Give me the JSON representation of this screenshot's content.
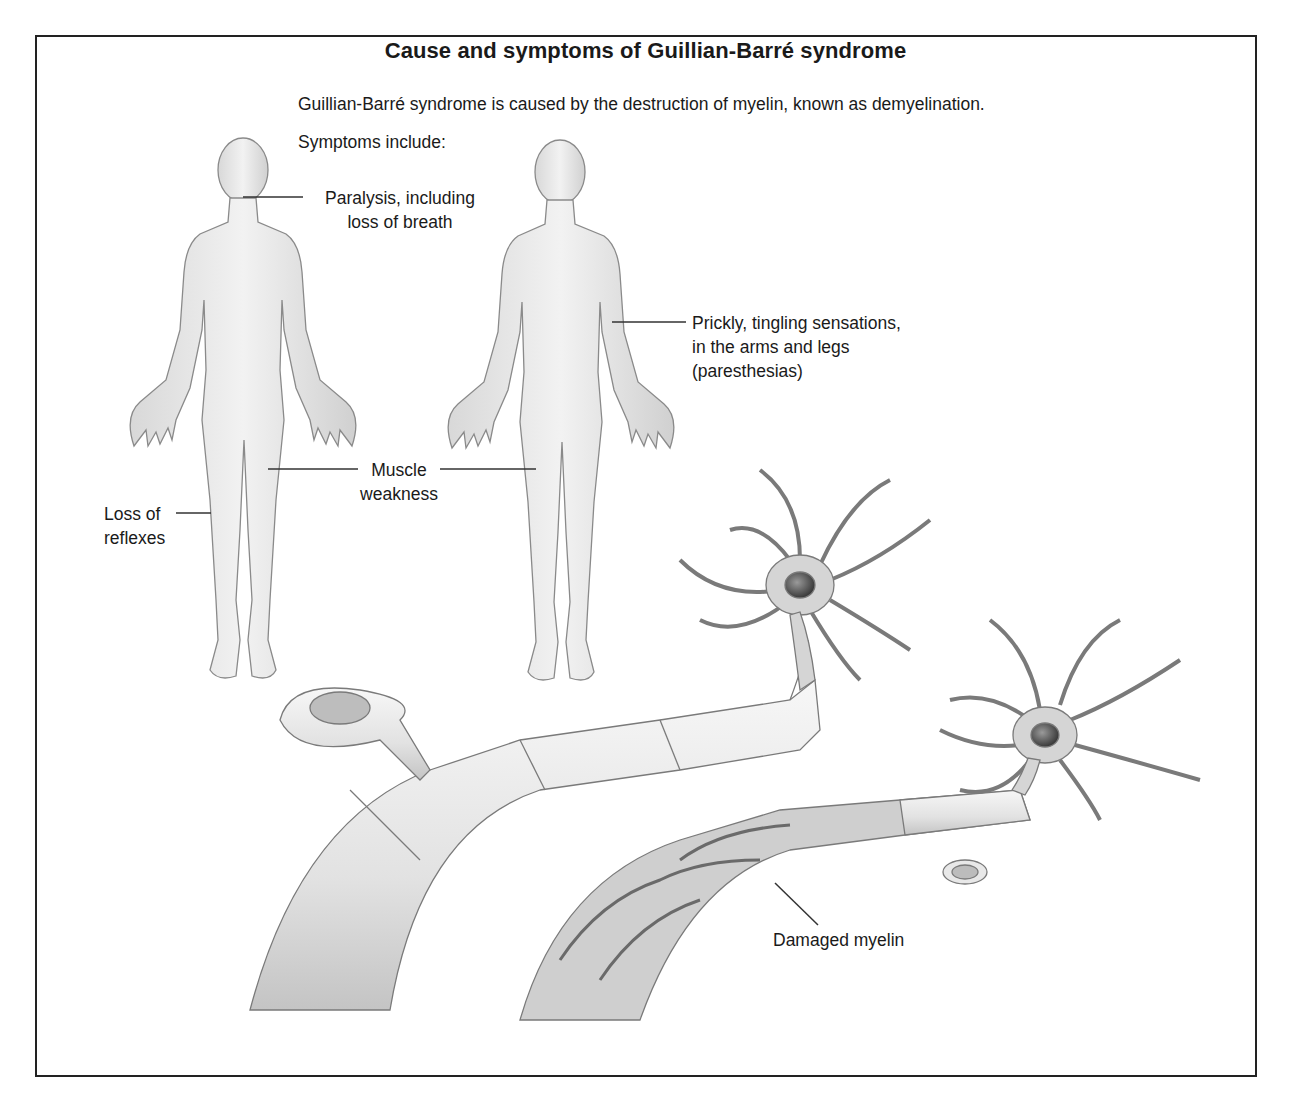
{
  "title": "Cause and symptoms of Guillian-Barré syndrome",
  "intro": "Guillian-Barré syndrome is caused by the destruction of myelin, known as demyelination.",
  "symptoms_heading": "Symptoms include:",
  "labels": {
    "paralysis": [
      "Paralysis, including",
      "loss of breath"
    ],
    "prickly": [
      "Prickly, tingling sensations,",
      "in the arms and legs",
      "(paresthesias)"
    ],
    "muscle": [
      "Muscle",
      "weakness"
    ],
    "reflexes": [
      "Loss of",
      "reflexes"
    ],
    "damaged_myelin": "Damaged myelin"
  },
  "colors": {
    "border": "#222222",
    "body_fill": "#e6e6e6",
    "body_stroke": "#8a8a8a",
    "myelin_fill": "#ececec",
    "axon_dark": "#9a9a9a",
    "neuron_fill": "#d5d5d5",
    "nucleus": "#555555"
  }
}
